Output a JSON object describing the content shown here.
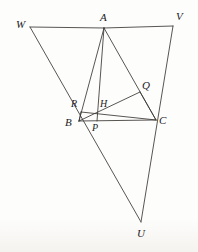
{
  "figure": {
    "type": "euclidean-geometry-diagram",
    "canvas": {
      "width": 198,
      "height": 252
    },
    "stroke_color": "#3a3734",
    "background_color": "#fdfdfc",
    "points": {
      "W": {
        "label": "W",
        "x": 30,
        "y": 27,
        "label_x": 16,
        "label_y": 19
      },
      "A": {
        "label": "A",
        "x": 104,
        "y": 28,
        "label_x": 100,
        "label_y": 12
      },
      "V": {
        "label": "V",
        "x": 173,
        "y": 26,
        "label_x": 176,
        "label_y": 11
      },
      "Q": {
        "label": "Q",
        "x": 140,
        "y": 92,
        "label_x": 142,
        "label_y": 80
      },
      "R": {
        "label": "R",
        "x": 81,
        "y": 112,
        "label_x": 71,
        "label_y": 99
      },
      "H": {
        "label": "H",
        "x": 105,
        "y": 114,
        "label_x": 100,
        "label_y": 99
      },
      "B": {
        "label": "B",
        "x": 79,
        "y": 121,
        "label_x": 65,
        "label_y": 117
      },
      "P": {
        "label": "P",
        "x": 97,
        "y": 121,
        "label_x": 92,
        "label_y": 123
      },
      "C": {
        "label": "C",
        "x": 156,
        "y": 120,
        "label_x": 159,
        "label_y": 115
      },
      "U": {
        "label": "U",
        "x": 141,
        "y": 222,
        "label_x": 137,
        "label_y": 228
      }
    },
    "segments": [
      {
        "name": "segment-WA",
        "from": "W",
        "to": "A"
      },
      {
        "name": "segment-AV",
        "from": "A",
        "to": "V"
      },
      {
        "name": "segment-WU",
        "from": "W",
        "to": "U"
      },
      {
        "name": "segment-VU",
        "from": "V",
        "to": "U"
      },
      {
        "name": "segment-AB",
        "from": "A",
        "to": "B"
      },
      {
        "name": "segment-AC",
        "from": "A",
        "to": "C"
      },
      {
        "name": "segment-BC",
        "from": "B",
        "to": "C"
      },
      {
        "name": "segment-AP",
        "from": "A",
        "to": "P"
      },
      {
        "name": "segment-BQ",
        "from": "B",
        "to": "Q"
      },
      {
        "name": "segment-CR",
        "from": "C",
        "to": "R"
      },
      {
        "name": "segment-QC",
        "from": "Q",
        "to": "C"
      },
      {
        "name": "segment-RB",
        "from": "R",
        "to": "B"
      }
    ],
    "labels_order": [
      "W",
      "A",
      "V",
      "Q",
      "R",
      "H",
      "B",
      "P",
      "C",
      "U"
    ]
  }
}
